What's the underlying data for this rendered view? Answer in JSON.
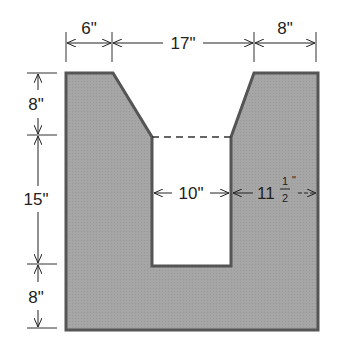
{
  "diagram": {
    "type": "dimensioned-cross-section",
    "shape_fill": "#a8a8a8",
    "shape_stroke": "#555555",
    "dimensions": {
      "top": [
        {
          "label": "6\"",
          "value_in": 6
        },
        {
          "label": "17\"",
          "value_in": 17
        },
        {
          "label": "8\"",
          "value_in": 8
        }
      ],
      "left": [
        {
          "label": "8\"",
          "value_in": 8
        },
        {
          "label": "15\"",
          "value_in": 15
        },
        {
          "label": "8\"",
          "value_in": 8
        }
      ],
      "inner_width": {
        "label": "10\"",
        "value_in": 10
      },
      "right_wall": {
        "whole": "11",
        "num": "1",
        "den": "2",
        "unit": "\"",
        "value_in": 11.5
      }
    }
  }
}
